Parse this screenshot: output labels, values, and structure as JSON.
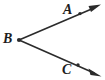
{
  "figure": {
    "type": "geometry-angle-diagram",
    "background_color": "#ffffff",
    "stroke_color": "#2b2b2b",
    "label_color": "#1d1d1d",
    "canvas": {
      "width": 105,
      "height": 80
    },
    "vertex": {
      "label": "B",
      "name": "vertex-point-b",
      "x": 19,
      "y": 40,
      "label_x": 3,
      "label_y": 32
    },
    "points": [
      {
        "label": "A",
        "name": "point-a",
        "x": 80,
        "y": 14,
        "label_x": 63,
        "label_y": 3
      },
      {
        "label": "C",
        "name": "point-c",
        "x": 78,
        "y": 65,
        "label_x": 62,
        "label_y": 63
      }
    ],
    "rays": [
      {
        "name": "ray-ba",
        "from": "B",
        "through": "A",
        "start_x": 19,
        "start_y": 40,
        "end_x": 101,
        "end_y": 5,
        "arrowhead": true
      },
      {
        "name": "ray-bc",
        "from": "B",
        "through": "C",
        "start_x": 19,
        "start_y": 40,
        "end_x": 101,
        "end_y": 76,
        "arrowhead": true
      }
    ],
    "labels": {
      "a": "A",
      "b": "B",
      "c": "C"
    }
  }
}
